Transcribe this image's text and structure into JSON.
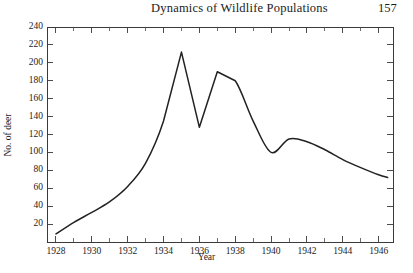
{
  "running_head": {
    "title": "Dynamics of Wildlife Populations",
    "page_number": "157"
  },
  "chart_data": {
    "type": "line",
    "title": "",
    "xlabel": "Year",
    "ylabel": "No. of deer",
    "xlim": [
      1927.5,
      1946.8
    ],
    "ylim": [
      0,
      240
    ],
    "grid": false,
    "legend": "none",
    "x_major_ticks": [
      1928,
      1930,
      1932,
      1934,
      1936,
      1938,
      1940,
      1942,
      1944,
      1946
    ],
    "x_major_tick_labels": [
      "1928",
      "1930",
      "1932",
      "1934",
      "1936",
      "1938",
      "1940",
      "1942",
      "1944",
      "1946"
    ],
    "x_minor_ticks": [
      1929,
      1931,
      1933,
      1935,
      1937,
      1939,
      1941,
      1943,
      1945
    ],
    "y_major_ticks": [
      20,
      40,
      60,
      80,
      100,
      120,
      140,
      160,
      180,
      200,
      220,
      240
    ],
    "y_major_tick_labels": [
      "20",
      "40",
      "60",
      "80",
      "100",
      "120",
      "140",
      "160",
      "180",
      "200",
      "220",
      "240"
    ],
    "series": [
      {
        "name": "deer population",
        "color": "#222222",
        "x": [
          1928,
          1929,
          1930,
          1931,
          1932,
          1933,
          1934,
          1935,
          1936,
          1937,
          1938,
          1939,
          1940,
          1941,
          1942,
          1943,
          1944,
          1945,
          1946,
          1946.5
        ],
        "values": [
          9,
          22,
          33,
          45,
          62,
          88,
          135,
          212,
          128,
          190,
          180,
          135,
          100,
          115,
          112,
          103,
          92,
          83,
          75,
          72
        ]
      }
    ]
  }
}
